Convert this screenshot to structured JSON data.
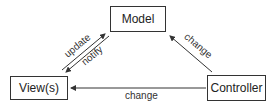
{
  "diagram": {
    "nodes": [
      {
        "id": "model",
        "label": "Model"
      },
      {
        "id": "view",
        "label": "View(s)"
      },
      {
        "id": "controller",
        "label": "Controller"
      }
    ],
    "edges": [
      {
        "from": "view",
        "to": "model",
        "label": "update"
      },
      {
        "from": "model",
        "to": "view",
        "label": "notify"
      },
      {
        "from": "controller",
        "to": "model",
        "label": "change"
      },
      {
        "from": "controller",
        "to": "view",
        "label": "change"
      }
    ],
    "colors": {
      "line": "#333333",
      "text": "#222222",
      "background": "#ffffff"
    }
  }
}
